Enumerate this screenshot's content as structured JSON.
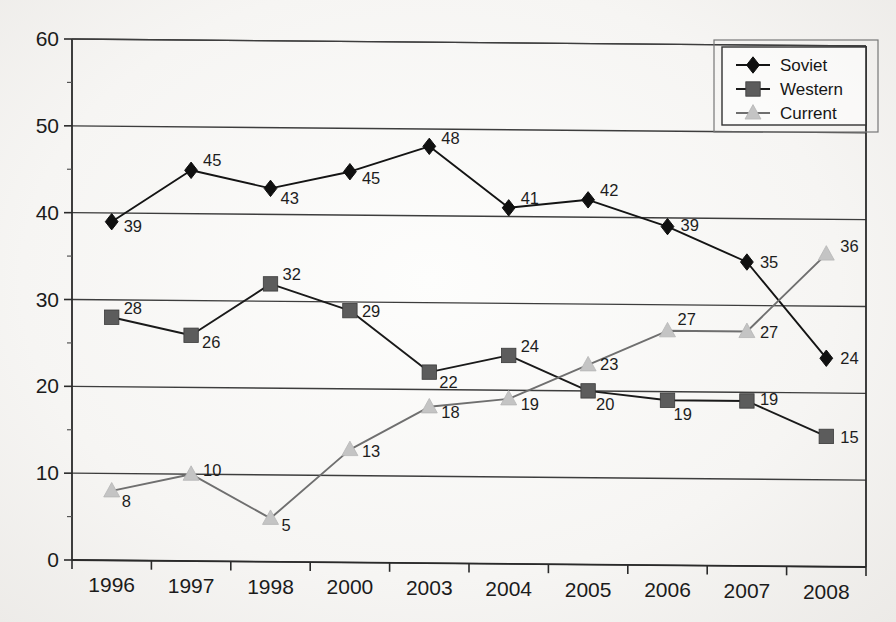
{
  "chart_data": {
    "type": "line",
    "title": "",
    "subtitle": "",
    "xlabel": "",
    "ylabel": "",
    "categories": [
      "1996",
      "1997",
      "1998",
      "2000",
      "2003",
      "2004",
      "2005",
      "2006",
      "2007",
      "2008"
    ],
    "ylim": [
      0,
      60
    ],
    "ytick_labels": [
      "0",
      "10",
      "20",
      "30",
      "40",
      "50",
      "60"
    ],
    "yticks": [
      0,
      10,
      20,
      30,
      40,
      50,
      60
    ],
    "grid": true,
    "grid_axis": "y",
    "legend_position": "top-right",
    "data_labels": true,
    "series": [
      {
        "name": "Soviet",
        "marker": "diamond",
        "color": "#101010",
        "line_color": "#141414",
        "values": [
          39,
          45,
          43,
          45,
          48,
          41,
          42,
          39,
          35,
          24
        ]
      },
      {
        "name": "Western",
        "marker": "square",
        "color": "#5c5c5c",
        "line_color": "#1a1a1a",
        "values": [
          28,
          26,
          32,
          29,
          22,
          24,
          20,
          19,
          19,
          15
        ]
      },
      {
        "name": "Current",
        "marker": "triangle",
        "color": "#c4c4c4",
        "line_color": "#6f6f6f",
        "values": [
          8,
          10,
          5,
          13,
          18,
          19,
          23,
          27,
          27,
          36
        ]
      }
    ]
  },
  "legend": {
    "entries": [
      {
        "label": "Soviet"
      },
      {
        "label": "Western"
      },
      {
        "label": "Current"
      }
    ]
  },
  "axes": {
    "y_labels": [
      "60",
      "50",
      "40",
      "30",
      "20",
      "10",
      "0"
    ],
    "x_labels": [
      "1996",
      "1997",
      "1998",
      "2000",
      "2003",
      "2004",
      "2005",
      "2006",
      "2007",
      "2008"
    ]
  }
}
